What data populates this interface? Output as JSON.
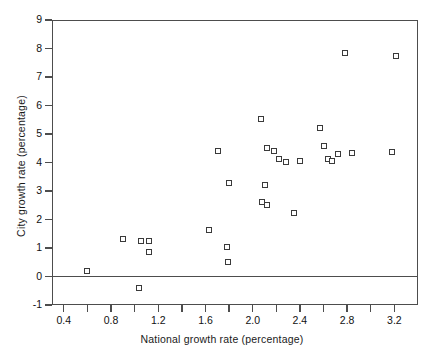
{
  "chart_data": {
    "type": "scatter",
    "title": "",
    "xlabel": "National growth rate (percentage)",
    "ylabel": "City growth rate (percentage)",
    "xlim": [
      0.3,
      3.4
    ],
    "ylim": [
      -1,
      9
    ],
    "xticks": [
      0.4,
      0.6,
      0.8,
      1.0,
      1.2,
      1.4,
      1.6,
      1.8,
      2.0,
      2.2,
      2.4,
      2.6,
      2.8,
      3.0,
      3.2
    ],
    "xtick_labels": [
      "0.4",
      "",
      "0.8",
      "",
      "1.2",
      "",
      "1.6",
      "",
      "2.0",
      "",
      "2.4",
      "",
      "2.8",
      "",
      "3.2"
    ],
    "yticks": [
      -1,
      0,
      1,
      2,
      3,
      4,
      5,
      6,
      7,
      8,
      9
    ],
    "ytick_labels": [
      "-1",
      "0",
      "1",
      "2",
      "3",
      "4",
      "5",
      "6",
      "7",
      "8",
      "9"
    ],
    "grid": false,
    "legend": false,
    "marker": "open-square",
    "reference_lines": [
      {
        "axis": "y",
        "value": 0
      }
    ],
    "points": [
      {
        "x": 0.6,
        "y": 0.2
      },
      {
        "x": 1.04,
        "y": -0.4
      },
      {
        "x": 0.9,
        "y": 1.32
      },
      {
        "x": 1.05,
        "y": 1.25
      },
      {
        "x": 1.12,
        "y": 1.26
      },
      {
        "x": 1.12,
        "y": 0.86
      },
      {
        "x": 1.63,
        "y": 1.62
      },
      {
        "x": 1.78,
        "y": 1.02
      },
      {
        "x": 1.79,
        "y": 0.5
      },
      {
        "x": 1.8,
        "y": 3.28
      },
      {
        "x": 1.71,
        "y": 4.42
      },
      {
        "x": 2.07,
        "y": 5.52
      },
      {
        "x": 2.12,
        "y": 4.5
      },
      {
        "x": 2.1,
        "y": 3.2
      },
      {
        "x": 2.08,
        "y": 2.62
      },
      {
        "x": 2.12,
        "y": 2.52
      },
      {
        "x": 2.18,
        "y": 4.42
      },
      {
        "x": 2.22,
        "y": 4.12
      },
      {
        "x": 2.28,
        "y": 4.02
      },
      {
        "x": 2.35,
        "y": 2.22
      },
      {
        "x": 2.4,
        "y": 4.05
      },
      {
        "x": 2.57,
        "y": 5.22
      },
      {
        "x": 2.6,
        "y": 4.58
      },
      {
        "x": 2.64,
        "y": 4.12
      },
      {
        "x": 2.67,
        "y": 4.06
      },
      {
        "x": 2.72,
        "y": 4.3
      },
      {
        "x": 2.78,
        "y": 7.85
      },
      {
        "x": 2.84,
        "y": 4.32
      },
      {
        "x": 3.18,
        "y": 4.38
      },
      {
        "x": 3.21,
        "y": 7.72
      }
    ]
  },
  "axes": {
    "x_title": "National growth rate (percentage)",
    "y_title": "City growth rate (percentage)"
  }
}
